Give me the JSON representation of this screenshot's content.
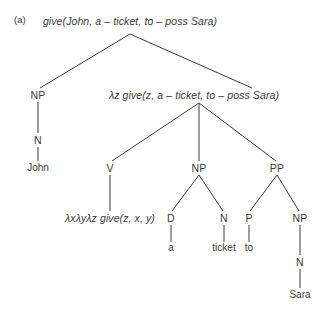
{
  "figure": {
    "panel_label": "(a)",
    "background_color": "#ffffff",
    "ink_color": "#3a3a3a",
    "width": 326,
    "height": 314
  },
  "tree": {
    "root": {
      "id": "root",
      "label": "give(John, a – ticket, to – poss Sara)",
      "kind": "semantic",
      "x": 130,
      "y": 21
    },
    "nodes": [
      {
        "id": "np-subj",
        "label": "NP",
        "kind": "category",
        "x": 38,
        "y": 95
      },
      {
        "id": "n-subj",
        "label": "N",
        "kind": "category",
        "x": 38,
        "y": 140
      },
      {
        "id": "john",
        "label": "John",
        "kind": "terminal",
        "x": 38,
        "y": 168
      },
      {
        "id": "vp-sem",
        "label": "λz give(z, a – ticket, to – poss Sara)",
        "kind": "semantic",
        "x": 194,
        "y": 95
      },
      {
        "id": "v",
        "label": "V",
        "kind": "category",
        "x": 110,
        "y": 168
      },
      {
        "id": "v-sem",
        "label": "λxλyλz give(z, x, y)",
        "kind": "semantic",
        "x": 110,
        "y": 218
      },
      {
        "id": "np-obj",
        "label": "NP",
        "kind": "category",
        "x": 199,
        "y": 168
      },
      {
        "id": "d",
        "label": "D",
        "kind": "category",
        "x": 171,
        "y": 218
      },
      {
        "id": "a",
        "label": "a",
        "kind": "terminal",
        "x": 171,
        "y": 248
      },
      {
        "id": "n-obj",
        "label": "N",
        "kind": "category",
        "x": 224,
        "y": 218
      },
      {
        "id": "ticket",
        "label": "ticket",
        "kind": "terminal",
        "x": 224,
        "y": 248
      },
      {
        "id": "pp",
        "label": "PP",
        "kind": "category",
        "x": 277,
        "y": 168
      },
      {
        "id": "p",
        "label": "P",
        "kind": "category",
        "x": 249,
        "y": 218
      },
      {
        "id": "to",
        "label": "to",
        "kind": "terminal",
        "x": 249,
        "y": 248
      },
      {
        "id": "np-goal",
        "label": "NP",
        "kind": "category",
        "x": 300,
        "y": 218
      },
      {
        "id": "n-goal",
        "label": "N",
        "kind": "category",
        "x": 300,
        "y": 262
      },
      {
        "id": "sara",
        "label": "Sara",
        "kind": "terminal",
        "x": 300,
        "y": 295
      }
    ],
    "edges": [
      {
        "from": "root-apex",
        "x1": 130,
        "y1": 34,
        "x2": 40,
        "y2": 88
      },
      {
        "from": "root-apex",
        "x1": 130,
        "y1": 34,
        "x2": 252,
        "y2": 88
      },
      {
        "from": "np-subj",
        "x1": 38,
        "y1": 102,
        "x2": 38,
        "y2": 133
      },
      {
        "from": "n-subj",
        "x1": 38,
        "y1": 147,
        "x2": 38,
        "y2": 161
      },
      {
        "from": "vp-sem",
        "x1": 199,
        "y1": 103,
        "x2": 112,
        "y2": 161
      },
      {
        "from": "vp-sem",
        "x1": 199,
        "y1": 103,
        "x2": 199,
        "y2": 161
      },
      {
        "from": "vp-sem",
        "x1": 199,
        "y1": 103,
        "x2": 276,
        "y2": 161
      },
      {
        "from": "v",
        "x1": 110,
        "y1": 175,
        "x2": 110,
        "y2": 211
      },
      {
        "from": "np-obj",
        "x1": 199,
        "y1": 175,
        "x2": 172,
        "y2": 211
      },
      {
        "from": "np-obj",
        "x1": 199,
        "y1": 175,
        "x2": 223,
        "y2": 211
      },
      {
        "from": "d",
        "x1": 171,
        "y1": 225,
        "x2": 171,
        "y2": 242
      },
      {
        "from": "n-obj",
        "x1": 224,
        "y1": 225,
        "x2": 224,
        "y2": 242
      },
      {
        "from": "pp",
        "x1": 277,
        "y1": 175,
        "x2": 250,
        "y2": 211
      },
      {
        "from": "pp",
        "x1": 277,
        "y1": 175,
        "x2": 299,
        "y2": 211
      },
      {
        "from": "p",
        "x1": 249,
        "y1": 225,
        "x2": 249,
        "y2": 242
      },
      {
        "from": "np-goal",
        "x1": 300,
        "y1": 225,
        "x2": 300,
        "y2": 255
      },
      {
        "from": "n-goal",
        "x1": 300,
        "y1": 269,
        "x2": 300,
        "y2": 288
      }
    ]
  }
}
